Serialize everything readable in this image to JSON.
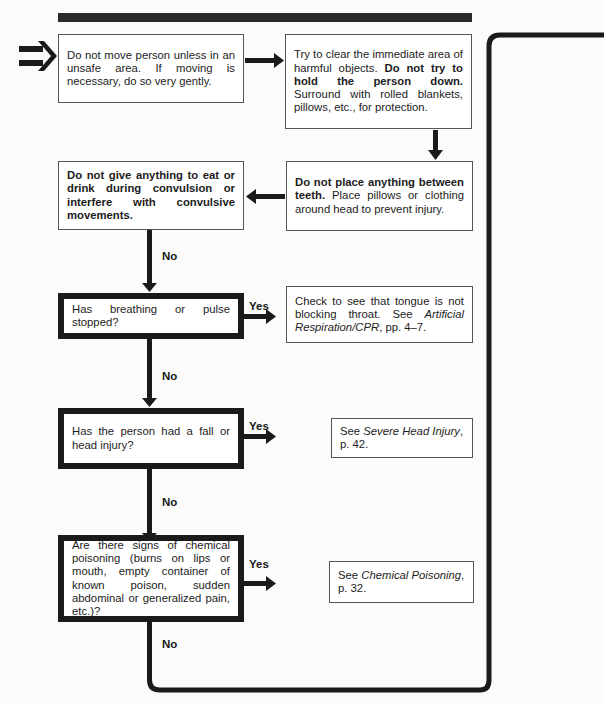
{
  "flowchart": {
    "nodes": {
      "n1": {
        "text": "Do not move person unless in an unsafe area. If moving is necessary, do so very gently."
      },
      "n2": {
        "pre": "Try to clear the immediate area of harmful objects. ",
        "bold": "Do not try to hold the person down.",
        "post": " Surround with rolled blankets, pillows, etc., for protection."
      },
      "n3": {
        "bold": "Do not place anything between teeth.",
        "post": " Place pillows or clothing around head to prevent injury."
      },
      "n4": {
        "bold": "Do not give anything to eat or drink during convulsion or interfere with convulsive movements."
      },
      "q1": {
        "text": "Has breathing or pulse stopped?"
      },
      "a1": {
        "pre": "Check to see that tongue is not blocking throat. See ",
        "italic": "Artificial Respiration/CPR",
        "post": ", pp. 4–7."
      },
      "q2": {
        "text": "Has the person had a fall or head injury?"
      },
      "a2": {
        "pre": "See ",
        "italic": "Severe Head Injury",
        "post": ", p. 42."
      },
      "q3": {
        "text": "Are there signs of chemical poisoning (burns on lips or mouth, empty container of known poison, sudden abdominal or generalized pain, etc.)?"
      },
      "a3": {
        "pre": "See ",
        "italic": "Chemical Poisoning",
        "post": ", p. 32."
      }
    },
    "labels": {
      "no1": "No",
      "yes1": "Yes",
      "no2": "No",
      "yes2": "Yes",
      "no3": "No",
      "yes3": "Yes",
      "no4": "No"
    },
    "icons": {
      "start": "double-arrow-right-icon"
    },
    "colors": {
      "line": "#1a1a1a",
      "box_border": "#555555",
      "background": "#fbfbfa"
    }
  }
}
